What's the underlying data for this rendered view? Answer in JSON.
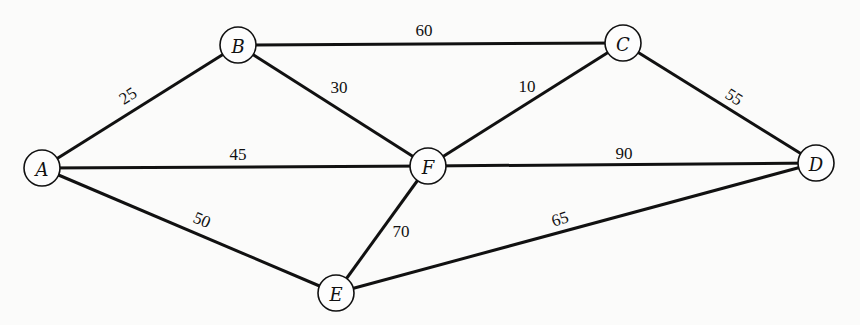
{
  "graph": {
    "nodes": [
      {
        "id": "A",
        "label": "A",
        "x": 42,
        "y": 168
      },
      {
        "id": "B",
        "label": "B",
        "x": 238,
        "y": 45
      },
      {
        "id": "C",
        "label": "C",
        "x": 623,
        "y": 43
      },
      {
        "id": "D",
        "label": "D",
        "x": 816,
        "y": 163
      },
      {
        "id": "F",
        "label": "F",
        "x": 428,
        "y": 166
      },
      {
        "id": "E",
        "label": "E",
        "x": 336,
        "y": 293
      }
    ],
    "edges": [
      {
        "from": "A",
        "to": "B",
        "weight": "25",
        "lx": 128,
        "ly": 96,
        "rot": -33
      },
      {
        "from": "B",
        "to": "C",
        "weight": "60",
        "lx": 424,
        "ly": 30,
        "rot": 0
      },
      {
        "from": "B",
        "to": "F",
        "weight": "30",
        "lx": 339,
        "ly": 87,
        "rot": 0
      },
      {
        "from": "A",
        "to": "F",
        "weight": "45",
        "lx": 238,
        "ly": 154,
        "rot": 0
      },
      {
        "from": "F",
        "to": "C",
        "weight": "10",
        "lx": 527,
        "ly": 86,
        "rot": 0
      },
      {
        "from": "C",
        "to": "D",
        "weight": "55",
        "lx": 734,
        "ly": 97,
        "rot": 33
      },
      {
        "from": "F",
        "to": "D",
        "weight": "90",
        "lx": 624,
        "ly": 153,
        "rot": 0
      },
      {
        "from": "A",
        "to": "E",
        "weight": "50",
        "lx": 202,
        "ly": 220,
        "rot": 23
      },
      {
        "from": "F",
        "to": "E",
        "weight": "70",
        "lx": 401,
        "ly": 231,
        "rot": 0
      },
      {
        "from": "E",
        "to": "D",
        "weight": "65",
        "lx": 560,
        "ly": 219,
        "rot": -17
      }
    ]
  }
}
